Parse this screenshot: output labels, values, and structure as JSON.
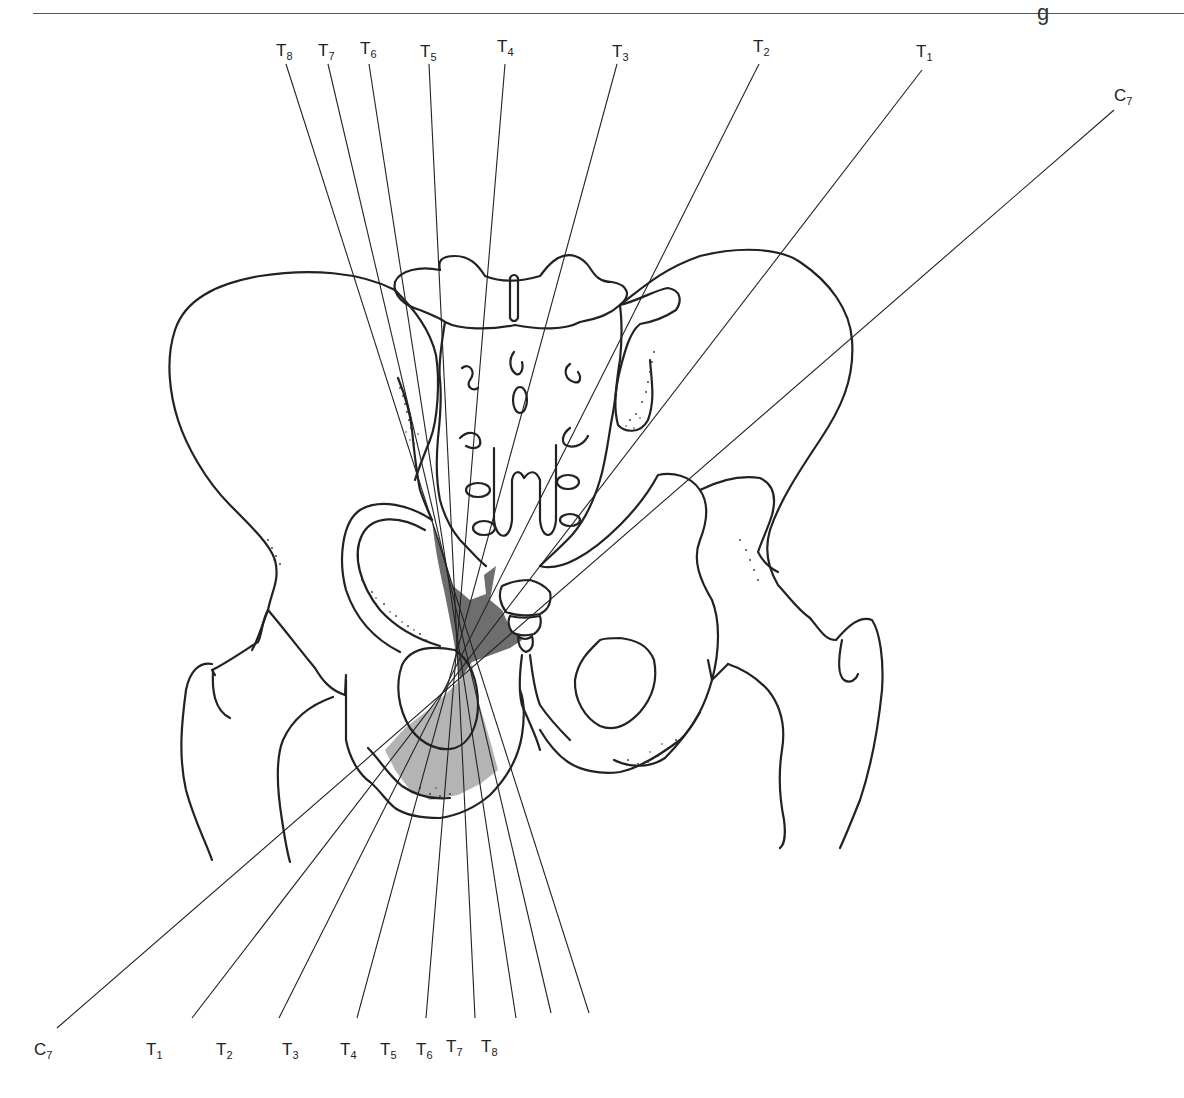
{
  "header": {
    "fragment_text": "g"
  },
  "figure": {
    "type": "anatomical-diagram",
    "colors": {
      "line": "#222222",
      "dark_shade": "#6e6e6e",
      "light_shade": "#b4b4b4",
      "background": "#ffffff"
    },
    "top_labels": [
      {
        "base": "T",
        "sub": "8",
        "x": 286,
        "y": 56
      },
      {
        "base": "T",
        "sub": "7",
        "x": 328,
        "y": 56
      },
      {
        "base": "T",
        "sub": "6",
        "x": 369,
        "y": 54
      },
      {
        "base": "T",
        "sub": "5",
        "x": 429,
        "y": 57
      },
      {
        "base": "T",
        "sub": "4",
        "x": 505,
        "y": 52
      },
      {
        "base": "T",
        "sub": "3",
        "x": 617,
        "y": 57
      },
      {
        "base": "T",
        "sub": "2",
        "x": 759,
        "y": 52
      },
      {
        "base": "T",
        "sub": "1",
        "x": 922,
        "y": 57
      },
      {
        "base": "C",
        "sub": "7",
        "x": 1114,
        "y": 101
      }
    ],
    "bottom_labels": [
      {
        "base": "C",
        "sub": "7",
        "x": 49,
        "y": 1055
      },
      {
        "base": "T",
        "sub": "1",
        "x": 182,
        "y": 1055
      },
      {
        "base": "T",
        "sub": "2",
        "x": 270,
        "y": 1055
      },
      {
        "base": "T",
        "sub": "3",
        "x": 348,
        "y": 1055
      },
      {
        "base": "T",
        "sub": "4",
        "x": 420,
        "y": 1055
      },
      {
        "base": "T",
        "sub": "5",
        "x": 467,
        "y": 1055
      },
      {
        "base": "T",
        "sub": "6",
        "x": 508,
        "y": 1055
      },
      {
        "base": "T",
        "sub": "7",
        "x": 543,
        "y": 1052
      },
      {
        "base": "T",
        "sub": "8",
        "x": 581,
        "y": 1052
      }
    ],
    "rays": [
      {
        "segment": "T8",
        "x1": 286,
        "y1": 64,
        "x2": 589,
        "y2": 1013
      },
      {
        "segment": "T7",
        "x1": 328,
        "y1": 64,
        "x2": 551,
        "y2": 1013
      },
      {
        "segment": "T6",
        "x1": 369,
        "y1": 64,
        "x2": 516,
        "y2": 1018
      },
      {
        "segment": "T5",
        "x1": 429,
        "y1": 64,
        "x2": 475,
        "y2": 1018
      },
      {
        "segment": "T4",
        "x1": 505,
        "y1": 64,
        "x2": 426,
        "y2": 1018
      },
      {
        "segment": "T3",
        "x1": 617,
        "y1": 64,
        "x2": 357,
        "y2": 1018
      },
      {
        "segment": "T2",
        "x1": 759,
        "y1": 64,
        "x2": 279,
        "y2": 1018
      },
      {
        "segment": "T1",
        "x1": 922,
        "y1": 70,
        "x2": 192,
        "y2": 1018
      },
      {
        "segment": "C7",
        "x1": 1114,
        "y1": 110,
        "x2": 57,
        "y2": 1028
      }
    ]
  }
}
